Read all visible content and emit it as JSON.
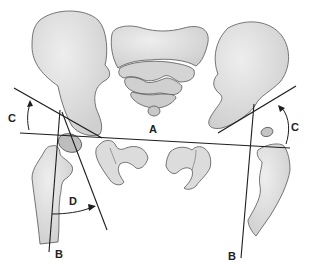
{
  "figure": {
    "labels": {
      "a": "A",
      "b_left": "B",
      "b_right": "B",
      "c_left": "C",
      "c_right": "C",
      "d": "D"
    },
    "colors": {
      "bone_fill": "#d9d9d9",
      "bone_fill_light": "#e6e6e6",
      "bone_outline": "#555555",
      "line": "#1e1e1e",
      "background": "#ffffff"
    }
  }
}
